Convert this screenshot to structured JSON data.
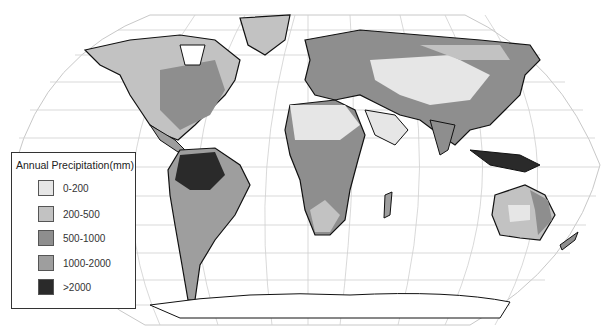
{
  "map": {
    "title": "Annual Precipitation World Map",
    "projection": "Robinson-like"
  },
  "legend": {
    "title": "Annual Precipitation(mm)",
    "items": [
      {
        "label": "0-200",
        "color": "#e6e6e6"
      },
      {
        "label": "200-500",
        "color": "#c2c2c2"
      },
      {
        "label": "500-1000",
        "color": "#8e8e8e"
      },
      {
        "label": "1000-2000",
        "color": "#9e9e9e"
      },
      {
        "label": ">2000",
        "color": "#2a2a2a"
      }
    ]
  },
  "colors": {
    "ocean": "#ffffff",
    "graticule": "#c8c8c8",
    "coastline": "#111111"
  }
}
